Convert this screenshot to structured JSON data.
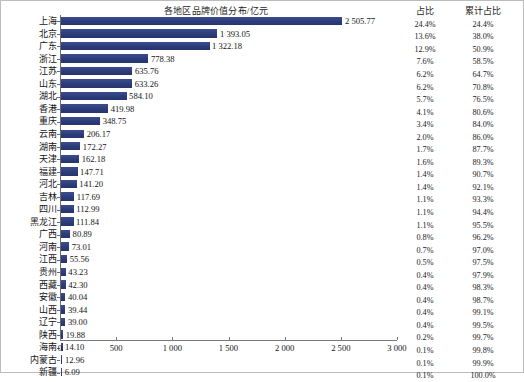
{
  "chart_data": {
    "type": "bar",
    "orientation": "horizontal",
    "title": "各地区品牌价值分布/亿元",
    "xlabel": "",
    "ylabel": "",
    "xlim": [
      0,
      3000
    ],
    "xticks": [
      0,
      500,
      1000,
      1500,
      2000,
      2500,
      3000
    ],
    "xtick_labels": [
      "0",
      "500",
      "1 000",
      "1 500",
      "2 000",
      "2 500",
      "3 000"
    ],
    "grid": false,
    "legend": null,
    "bar_color": "#2e3f7f",
    "categories": [
      "上海",
      "北京",
      "广东",
      "浙江",
      "江苏",
      "山东",
      "湖北",
      "香港",
      "重庆",
      "云南",
      "湖南",
      "天津",
      "福建",
      "河北",
      "吉林",
      "四川",
      "黑龙江",
      "广西",
      "河南",
      "江西",
      "贵州",
      "西藏",
      "安徽",
      "山西",
      "辽宁",
      "陕西",
      "海南",
      "内蒙古",
      "新疆"
    ],
    "values": [
      2505.77,
      1393.05,
      1322.18,
      778.38,
      635.76,
      633.26,
      584.1,
      419.98,
      348.75,
      206.17,
      172.27,
      162.18,
      147.71,
      141.2,
      117.69,
      112.99,
      111.84,
      80.89,
      73.01,
      55.56,
      43.23,
      42.3,
      40.04,
      39.44,
      39.0,
      19.88,
      14.1,
      12.96,
      6.09
    ],
    "value_labels": [
      "2 505.77",
      "1 393.05",
      "1 322.18",
      "778.38",
      "635.76",
      "633.26",
      "584.10",
      "419.98",
      "348.75",
      "206.17",
      "172.27",
      "162.18",
      "147.71",
      "141.20",
      "117.69",
      "112.99",
      "111.84",
      "80.89",
      "73.01",
      "55.56",
      "43.23",
      "42.30",
      "40.04",
      "39.44",
      "39.00",
      "19.88",
      "14.10",
      "12.96",
      "6.09"
    ],
    "share_header": "占比",
    "cumulative_header": "累计占比",
    "share": [
      "24.4%",
      "13.6%",
      "12.9%",
      "7.6%",
      "6.2%",
      "6.2%",
      "5.7%",
      "4.1%",
      "3.4%",
      "2.0%",
      "1.7%",
      "1.6%",
      "1.4%",
      "1.4%",
      "1.1%",
      "1.1%",
      "1.1%",
      "0.8%",
      "0.7%",
      "0.5%",
      "0.4%",
      "0.4%",
      "0.4%",
      "0.4%",
      "0.4%",
      "0.2%",
      "0.1%",
      "0.1%",
      "0.1%"
    ],
    "cumulative": [
      "24.4%",
      "38.0%",
      "50.9%",
      "58.5%",
      "64.7%",
      "70.8%",
      "76.5%",
      "80.6%",
      "84.0%",
      "86.0%",
      "87.7%",
      "89.3%",
      "90.7%",
      "92.1%",
      "93.3%",
      "94.4%",
      "95.5%",
      "96.2%",
      "97.0%",
      "97.5%",
      "97.9%",
      "98.3%",
      "98.7%",
      "99.1%",
      "99.5%",
      "99.7%",
      "99.8%",
      "99.9%",
      "100.0%"
    ]
  }
}
